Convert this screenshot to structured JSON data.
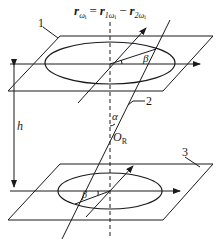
{
  "formula": {
    "lhs": "r",
    "lhs_sub": "ω",
    "lhs_subsub": "i",
    "eq": "=",
    "t1": "r",
    "t1_sub": "1ω",
    "t1_subsub": "i",
    "minus": "−",
    "t2": "r",
    "t2_sub": "2ω",
    "t2_subsub": "i"
  },
  "labels": {
    "part1": "1",
    "part2": "2",
    "part3": "3",
    "height": "h",
    "angle_alpha": "α",
    "angle_beta_top": "β",
    "angle_beta_bottom": "β",
    "center_O": "O",
    "center_O_sub": "R"
  },
  "colors": {
    "stroke": "#1a1a1a",
    "background": "#ffffff"
  }
}
